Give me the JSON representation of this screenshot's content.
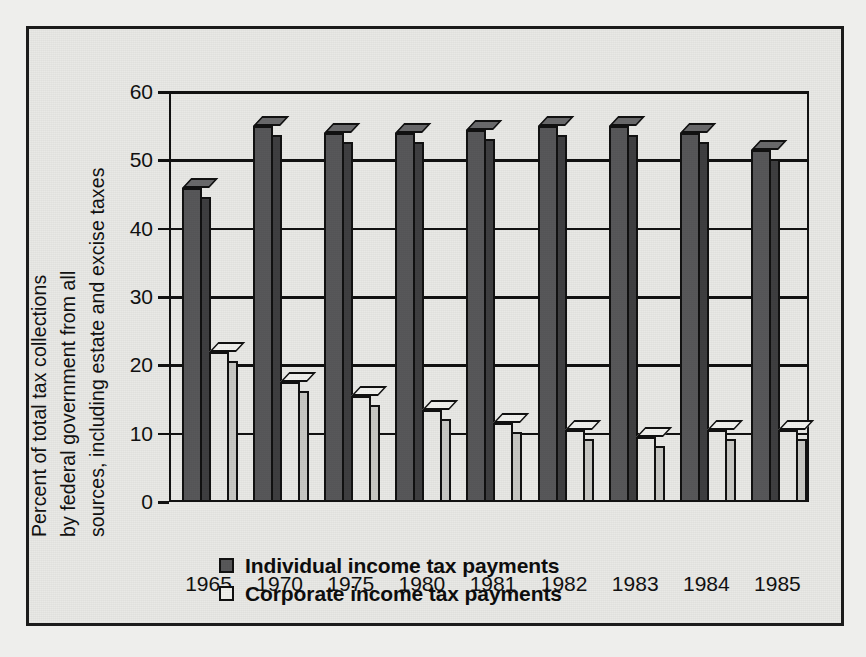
{
  "figure": {
    "background_color": "#e9e9e6",
    "frame_color": "#1b1b1b"
  },
  "chart_data": {
    "type": "bar",
    "title": "",
    "subtitle": "",
    "xlabel": "",
    "ylabel": "Percent of total tax collections by federal government from all sources, including estate and excise taxes",
    "ylabel_lines": [
      "Percent of total tax collections",
      "by federal government from all",
      "sources, including estate and excise taxes"
    ],
    "categories": [
      "1965",
      "1970",
      "1975",
      "1980",
      "1981",
      "1982",
      "1983",
      "1984",
      "1985"
    ],
    "series": [
      {
        "name": "Individual income tax payments",
        "color": "#58585a",
        "values": [
          46,
          55,
          54,
          54,
          54.5,
          55,
          55,
          54,
          51.5
        ]
      },
      {
        "name": "Corporate income tax payments",
        "color": "#f1f1ee",
        "values": [
          22,
          17.5,
          15.5,
          13.5,
          11.5,
          10.5,
          9.5,
          10.5,
          10.5
        ]
      }
    ],
    "ylim": [
      0,
      60
    ],
    "yticks": [
      0,
      10,
      20,
      30,
      40,
      50,
      60
    ],
    "ytick_labels": [
      "0",
      "10",
      "20",
      "30",
      "40",
      "50",
      "60"
    ],
    "grid": true,
    "grid_axis": "y",
    "legend_position": "below-axes-left",
    "style": "3d-bars-monochrome"
  },
  "legend": {
    "entries": [
      {
        "label": "Individual income tax payments",
        "swatch": "dark"
      },
      {
        "label": "Corporate income tax payments",
        "swatch": "light"
      }
    ]
  }
}
